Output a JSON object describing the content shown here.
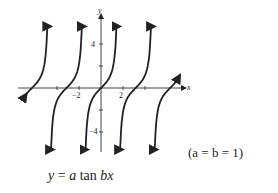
{
  "chart_data": {
    "type": "line",
    "title": "",
    "function": "y = a tan bx",
    "parameters": "(a = b = 1)",
    "xlabel": "x",
    "ylabel": "y",
    "x_ticks": [
      -4,
      -2,
      2,
      4
    ],
    "x_tick_labels": [
      "-2",
      "2"
    ],
    "y_ticks": [
      4,
      2,
      -2,
      -4
    ],
    "y_tick_labels": [
      "4",
      "-4"
    ],
    "xlim": [
      -7.5,
      7.5
    ],
    "ylim": [
      -5.5,
      6
    ],
    "asymptotes": [
      -4.712,
      -1.571,
      1.571,
      4.712
    ],
    "zero_crossings": [
      -6.283,
      -3.142,
      0,
      3.142,
      6.283
    ],
    "grid": false
  },
  "labels": {
    "x_axis": "x",
    "y_axis": "y",
    "tick_neg2": "−2",
    "tick_2": "2",
    "tick_4": "4",
    "tick_neg4": "−4",
    "equation_y": "y",
    "equation_eq": " = ",
    "equation_a": "a",
    "equation_tan": " tan ",
    "equation_bx": "bx",
    "condition": "(a = b = 1)"
  }
}
